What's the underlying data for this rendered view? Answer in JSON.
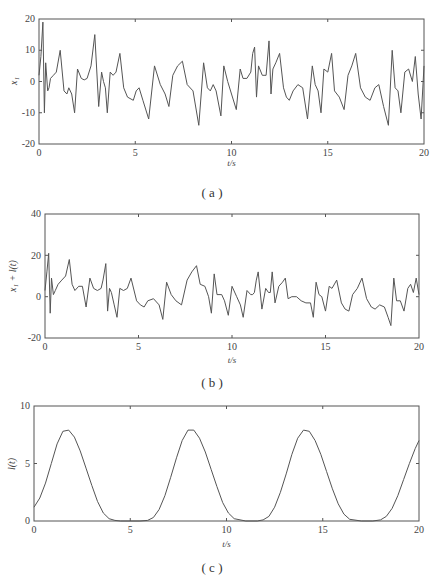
{
  "chart_data": [
    {
      "id": "a",
      "type": "line",
      "caption": "( a )",
      "xlabel": "t/s",
      "ylabel": "x1",
      "xlim": [
        0,
        20
      ],
      "ylim": [
        -20,
        20
      ],
      "xticks": [
        0,
        5,
        10,
        15,
        20
      ],
      "yticks": [
        -20,
        -10,
        0,
        10,
        20
      ],
      "grid": false,
      "frame": {
        "left": 39,
        "right": 424,
        "top": 19,
        "bottom": 144
      },
      "series": [
        {
          "name": "x1",
          "x": [
            0,
            0.1,
            0.2,
            0.28,
            0.35,
            0.45,
            0.52,
            0.6,
            0.75,
            0.9,
            1.1,
            1.3,
            1.45,
            1.55,
            1.7,
            1.85,
            2.0,
            2.2,
            2.35,
            2.5,
            2.7,
            2.9,
            3.1,
            3.25,
            3.35,
            3.45,
            3.55,
            3.7,
            3.85,
            4.0,
            4.2,
            4.4,
            4.6,
            4.9,
            5.05,
            5.2,
            5.4,
            5.7,
            6.0,
            6.3,
            6.55,
            6.75,
            6.95,
            7.2,
            7.45,
            7.7,
            8.0,
            8.3,
            8.55,
            8.75,
            8.9,
            9.05,
            9.2,
            9.45,
            9.6,
            9.8,
            10.0,
            10.25,
            10.45,
            10.6,
            10.8,
            11.0,
            11.1,
            11.2,
            11.3,
            11.4,
            11.6,
            11.8,
            11.95,
            12.05,
            12.15,
            12.3,
            12.5,
            12.7,
            12.85,
            13.0,
            13.2,
            13.45,
            13.7,
            13.95,
            14.2,
            14.35,
            14.5,
            14.65,
            14.8,
            15.0,
            15.2,
            15.35,
            15.6,
            15.85,
            16.05,
            16.25,
            16.45,
            16.7,
            16.95,
            17.2,
            17.45,
            17.65,
            17.9,
            18.15,
            18.35,
            18.5,
            18.65,
            18.8,
            19.0,
            19.2,
            19.4,
            19.55,
            19.7,
            19.85,
            20.0
          ],
          "y": [
            2,
            8,
            19,
            -10,
            6,
            -3,
            -2,
            1,
            2,
            3,
            10,
            -3,
            -4,
            -2,
            -4,
            -10,
            4,
            1,
            0.5,
            1,
            5,
            15,
            -8,
            3,
            0,
            -2,
            -10,
            3,
            2,
            3,
            9,
            -2,
            -5,
            -6,
            -3,
            -2,
            -6,
            -12,
            5,
            -1,
            -4,
            -8,
            2,
            5,
            6.5,
            -1,
            -3,
            -14,
            6,
            -2,
            -3,
            -1,
            -3,
            -11,
            5,
            0,
            -4,
            -9,
            4,
            1,
            1,
            3,
            9,
            11,
            -5,
            5,
            2,
            2,
            13,
            -4,
            4,
            6,
            9,
            -2,
            -5,
            -6,
            -3,
            -1,
            -2,
            -12,
            5,
            -1,
            -3,
            -10,
            4,
            3,
            9,
            -3,
            -5,
            -9,
            2,
            5,
            9,
            -2,
            -5,
            -6,
            -2,
            -1,
            -8,
            -14,
            10,
            -2,
            -3,
            -10,
            3,
            4,
            0,
            8,
            -4,
            -12,
            5,
            2,
            2
          ]
        }
      ]
    },
    {
      "id": "b",
      "type": "line",
      "caption": "( b )",
      "xlabel": "t/s",
      "ylabel": "x1 + l(t)",
      "xlim": [
        0,
        20
      ],
      "ylim": [
        -20,
        40
      ],
      "xticks": [
        0,
        5,
        10,
        15,
        20
      ],
      "yticks": [
        -20,
        0,
        20,
        40
      ],
      "grid": false,
      "frame": {
        "left": 45,
        "right": 419,
        "top": 214,
        "bottom": 338
      },
      "series": [
        {
          "name": "x1 + l(t)",
          "x": [
            0,
            0.1,
            0.2,
            0.28,
            0.35,
            0.45,
            0.55,
            0.7,
            0.9,
            1.1,
            1.3,
            1.45,
            1.6,
            1.8,
            2.0,
            2.2,
            2.4,
            2.6,
            2.8,
            3.0,
            3.1,
            3.25,
            3.35,
            3.45,
            3.55,
            3.7,
            3.85,
            4.0,
            4.2,
            4.4,
            4.6,
            4.9,
            5.1,
            5.3,
            5.5,
            5.8,
            6.1,
            6.3,
            6.5,
            6.75,
            7.0,
            7.3,
            7.6,
            7.85,
            8.1,
            8.3,
            8.55,
            8.75,
            8.9,
            9.05,
            9.2,
            9.45,
            9.6,
            9.8,
            10.0,
            10.25,
            10.45,
            10.6,
            10.8,
            11.0,
            11.1,
            11.2,
            11.3,
            11.4,
            11.6,
            11.8,
            11.95,
            12.05,
            12.15,
            12.3,
            12.5,
            12.7,
            12.85,
            13.0,
            13.2,
            13.45,
            13.7,
            13.95,
            14.2,
            14.35,
            14.5,
            14.65,
            14.8,
            15.0,
            15.2,
            15.35,
            15.6,
            15.85,
            16.05,
            16.25,
            16.45,
            16.7,
            16.95,
            17.2,
            17.45,
            17.65,
            17.9,
            18.15,
            18.35,
            18.5,
            18.65,
            18.8,
            19.0,
            19.2,
            19.4,
            19.55,
            19.7,
            19.85,
            20.0
          ],
          "y": [
            3,
            12,
            21,
            -8,
            9,
            1,
            3,
            6,
            8,
            10,
            18,
            6,
            3,
            5,
            5,
            -5,
            9,
            4,
            3,
            4,
            8,
            16,
            -7,
            4,
            2,
            -4,
            -10,
            4,
            3,
            4,
            9,
            -2,
            -4,
            -5,
            -2,
            -1,
            -4,
            -11,
            7,
            1,
            -2,
            -4,
            8,
            12,
            15,
            6,
            5,
            0,
            -8,
            11,
            1,
            1,
            -2,
            -9,
            5,
            0,
            -4,
            -10,
            3,
            1,
            1,
            2,
            8,
            12,
            -6,
            4,
            2,
            2,
            12,
            -3,
            5,
            7,
            9,
            -1,
            0,
            0,
            -2,
            -3,
            -3,
            -10,
            7,
            1,
            0,
            -7,
            5,
            4,
            8,
            -3,
            -6,
            -7,
            1,
            4,
            9,
            -1,
            -5,
            -6,
            -4,
            -5,
            -10,
            -14,
            9,
            -2,
            -2,
            -7,
            4,
            6,
            2,
            9,
            1,
            -3,
            1,
            5,
            4
          ]
        }
      ]
    },
    {
      "id": "c",
      "type": "line",
      "caption": "( c )",
      "xlabel": "t/s",
      "ylabel": "l(t)",
      "xlim": [
        0,
        20
      ],
      "ylim": [
        0,
        10
      ],
      "xticks": [
        0,
        5,
        10,
        15,
        20
      ],
      "yticks": [
        0,
        5,
        10
      ],
      "grid": false,
      "frame": {
        "left": 34,
        "right": 419,
        "top": 406,
        "bottom": 521
      },
      "series": [
        {
          "name": "l(t)",
          "x": [
            0,
            0.3,
            0.6,
            0.9,
            1.2,
            1.5,
            1.8,
            2.1,
            2.4,
            2.7,
            3.0,
            3.3,
            3.6,
            3.9,
            4.2,
            4.5,
            5.0,
            5.5,
            5.9,
            6.2,
            6.5,
            6.8,
            7.1,
            7.4,
            7.7,
            8.0,
            8.3,
            8.6,
            8.9,
            9.2,
            9.5,
            9.8,
            10.1,
            10.4,
            11.0,
            11.6,
            11.9,
            12.2,
            12.5,
            12.8,
            13.1,
            13.4,
            13.7,
            14.0,
            14.3,
            14.6,
            14.9,
            15.2,
            15.5,
            15.8,
            16.1,
            16.4,
            17.0,
            17.6,
            18.0,
            18.3,
            18.6,
            18.9,
            19.2,
            19.5,
            19.8,
            20.0
          ],
          "y": [
            1.2,
            2.0,
            3.3,
            5.0,
            6.7,
            7.8,
            7.9,
            7.3,
            6.1,
            4.6,
            3.1,
            1.7,
            0.7,
            0.2,
            0.05,
            0,
            0,
            0,
            0.05,
            0.3,
            1.0,
            2.2,
            3.8,
            5.5,
            7.0,
            7.9,
            7.9,
            7.2,
            6.0,
            4.5,
            3.0,
            1.6,
            0.7,
            0.2,
            0,
            0,
            0.1,
            0.4,
            1.2,
            2.5,
            4.1,
            5.8,
            7.2,
            7.9,
            7.8,
            7.0,
            5.8,
            4.3,
            2.8,
            1.5,
            0.6,
            0.15,
            0,
            0,
            0.1,
            0.4,
            1.1,
            2.2,
            3.6,
            5.0,
            6.3,
            7.0
          ]
        }
      ]
    }
  ],
  "panels": {
    "a": {
      "caption": "( a )",
      "xlabel": "t/s",
      "ylabel": "x₁",
      "xticks": [
        "0",
        "5",
        "10",
        "15",
        "20"
      ],
      "yticks": [
        "20",
        "10",
        "0",
        "-10",
        "-20"
      ]
    },
    "b": {
      "caption": "( b )",
      "xlabel": "t/s",
      "ylabel": "x₁ + l(t)",
      "xticks": [
        "0",
        "5",
        "10",
        "15",
        "20"
      ],
      "yticks": [
        "40",
        "20",
        "0",
        "-20"
      ]
    },
    "c": {
      "caption": "( c )",
      "xlabel": "t/s",
      "ylabel": "l(t)",
      "xticks": [
        "0",
        "5",
        "10",
        "15",
        "20"
      ],
      "yticks": [
        "10",
        "5",
        "0"
      ]
    }
  }
}
